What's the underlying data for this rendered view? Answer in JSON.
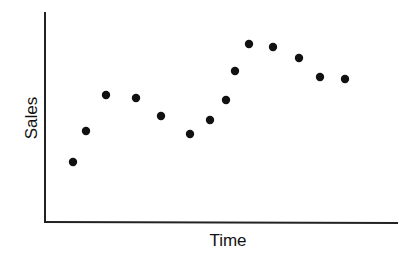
{
  "chart_data": {
    "type": "scatter",
    "title": "",
    "xlabel": "Time",
    "ylabel": "Sales",
    "x_ticks": [],
    "y_ticks": [],
    "grid": false,
    "legend": null,
    "series": [
      {
        "name": "Sales",
        "color": "#111111",
        "x": [
          1,
          2,
          3,
          4,
          5,
          6,
          7,
          8,
          9,
          10,
          11,
          12,
          13,
          14
        ],
        "y": [
          28,
          43,
          60,
          59,
          50,
          42,
          48,
          58,
          72,
          85,
          83,
          78,
          69,
          68
        ],
        "pixel_points": [
          [
            73,
            162
          ],
          [
            86,
            131
          ],
          [
            106,
            95
          ],
          [
            136,
            98
          ],
          [
            161,
            116
          ],
          [
            190,
            134
          ],
          [
            210,
            120
          ],
          [
            226,
            100
          ],
          [
            235,
            71
          ],
          [
            249,
            44
          ],
          [
            273,
            47
          ],
          [
            299,
            58
          ],
          [
            320,
            77
          ],
          [
            345,
            79
          ]
        ]
      }
    ],
    "xlim": [
      0,
      17
    ],
    "ylim": [
      0,
      100
    ]
  },
  "axes": {
    "x_label": "Time",
    "y_label": "Sales",
    "color": "#222222"
  }
}
